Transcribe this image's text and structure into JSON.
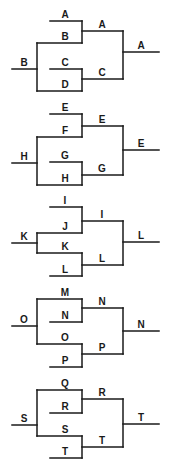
{
  "diagram": {
    "type": "tournament-brackets",
    "colors": {
      "line": "#1a1a1a",
      "background": "#ffffff"
    },
    "brackets": [
      {
        "id": "bracket-1",
        "entry": {
          "label": "B",
          "y": 69
        },
        "slots": [
          {
            "label": "A",
            "y": 21,
            "x1": 50
          },
          {
            "label": "B",
            "y": 43,
            "x1": 37
          },
          {
            "label": "C",
            "y": 69,
            "x1": 50
          },
          {
            "label": "D",
            "y": 91,
            "x1": 37
          }
        ],
        "left_vertical": [
          43,
          91
        ],
        "semis": [
          {
            "label": "A",
            "y": 31,
            "span": [
              21,
              43
            ]
          },
          {
            "label": "C",
            "y": 79,
            "span": [
              69,
              91
            ]
          }
        ],
        "final": {
          "label": "A",
          "y": 52
        }
      },
      {
        "id": "bracket-2",
        "entry": {
          "label": "H",
          "y": 163
        },
        "slots": [
          {
            "label": "E",
            "y": 114,
            "x1": 50
          },
          {
            "label": "F",
            "y": 137,
            "x1": 37
          },
          {
            "label": "G",
            "y": 162,
            "x1": 50
          },
          {
            "label": "H",
            "y": 185,
            "x1": 37
          }
        ],
        "left_vertical": [
          137,
          185
        ],
        "semis": [
          {
            "label": "E",
            "y": 126,
            "span": [
              114,
              137
            ]
          },
          {
            "label": "G",
            "y": 175,
            "span": [
              162,
              185
            ]
          }
        ],
        "final": {
          "label": "E",
          "y": 150
        }
      },
      {
        "id": "bracket-3",
        "entry": {
          "label": "K",
          "y": 243
        },
        "slots": [
          {
            "label": "I",
            "y": 207,
            "x1": 50
          },
          {
            "label": "J",
            "y": 233,
            "x1": 37
          },
          {
            "label": "K",
            "y": 253,
            "x1": 37
          },
          {
            "label": "L",
            "y": 276,
            "x1": 50
          }
        ],
        "left_vertical": [
          233,
          253
        ],
        "semis": [
          {
            "label": "I",
            "y": 221,
            "span": [
              207,
              233
            ]
          },
          {
            "label": "L",
            "y": 265,
            "span": [
              253,
              276
            ]
          }
        ],
        "final": {
          "label": "L",
          "y": 242
        }
      },
      {
        "id": "bracket-4",
        "entry": {
          "label": "O",
          "y": 326
        },
        "slots": [
          {
            "label": "M",
            "y": 299,
            "x1": 37
          },
          {
            "label": "N",
            "y": 322,
            "x1": 50
          },
          {
            "label": "O",
            "y": 344,
            "x1": 37
          },
          {
            "label": "P",
            "y": 367,
            "x1": 50
          }
        ],
        "left_vertical": [
          299,
          344
        ],
        "semis": [
          {
            "label": "N",
            "y": 308,
            "span": [
              299,
              322
            ]
          },
          {
            "label": "P",
            "y": 354,
            "span": [
              344,
              367
            ]
          }
        ],
        "final": {
          "label": "N",
          "y": 331
        }
      },
      {
        "id": "bracket-5",
        "entry": {
          "label": "S",
          "y": 425
        },
        "slots": [
          {
            "label": "Q",
            "y": 390,
            "x1": 37
          },
          {
            "label": "R",
            "y": 413,
            "x1": 50
          },
          {
            "label": "S",
            "y": 436,
            "x1": 37
          },
          {
            "label": "T",
            "y": 458,
            "x1": 50
          }
        ],
        "left_vertical": [
          390,
          436
        ],
        "semis": [
          {
            "label": "R",
            "y": 399,
            "span": [
              390,
              413
            ]
          },
          {
            "label": "T",
            "y": 447,
            "span": [
              436,
              458
            ]
          }
        ],
        "final": {
          "label": "T",
          "y": 424
        }
      }
    ]
  }
}
